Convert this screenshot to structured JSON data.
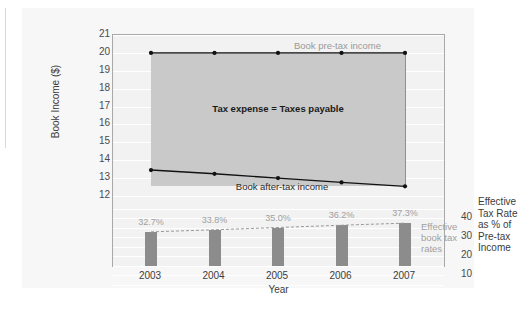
{
  "chart_data": {
    "type": "line",
    "title": "",
    "xlabel": "Year",
    "ylabel": "Book Income ($)",
    "categories": [
      "2003",
      "2004",
      "2005",
      "2006",
      "2007"
    ],
    "ylim": [
      12,
      21
    ],
    "y_ticks": [
      "21",
      "20",
      "19",
      "18",
      "17",
      "16",
      "15",
      "14",
      "13",
      "12"
    ],
    "secondary_ylabel": "Effective Tax Rate as % of Pre-tax Income",
    "secondary_ylim": [
      0,
      45
    ],
    "secondary_y_ticks": [
      "40",
      "30",
      "20",
      "10"
    ],
    "grid": true,
    "legend_position": "inline-annotations",
    "series": [
      {
        "name": "Book pre-tax income",
        "type": "line",
        "values": [
          20.0,
          20.0,
          20.0,
          20.0,
          20.0
        ],
        "label": "Book pre-tax income"
      },
      {
        "name": "Book after-tax income",
        "type": "line",
        "values": [
          13.45,
          13.24,
          13.0,
          12.76,
          12.54
        ],
        "label": "Book after-tax income"
      },
      {
        "name": "Effective book tax rates",
        "type": "bar",
        "values": [
          32.7,
          33.8,
          35.0,
          36.2,
          37.3
        ],
        "value_labels": [
          "32.7%",
          "33.8%",
          "35.0%",
          "36.2%",
          "37.3%"
        ],
        "label": "Effective\nbook tax\nrates"
      }
    ],
    "annotations": [
      {
        "name": "tax-expense-band",
        "text": "Tax expense = Taxes payable"
      }
    ],
    "colors": {
      "plot_background": "#f2f2f2",
      "panel_background": "#f7f7f7",
      "gridline": "#ffffff",
      "band_fill": "#c9c9c9",
      "bar_fill": "#8c8c8c",
      "line": "#111111",
      "muted_text": "#a0a0a0",
      "axis_text": "#3c3c3c",
      "frame": "#a8a8a8"
    }
  },
  "secondary_axis_title_lines": [
    "Effective",
    "Tax Rate",
    "as % of",
    "Pre-tax",
    "Income"
  ],
  "bars_annotation_lines": [
    "Effective",
    "book tax",
    "rates"
  ]
}
